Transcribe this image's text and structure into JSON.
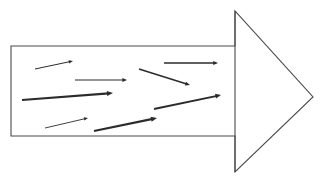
{
  "figure": {
    "canvas": {
      "width": 325,
      "height": 181,
      "background": "#ffffff"
    },
    "outline": {
      "name": "big-arrow-outline",
      "stroke_color": "#4a4a4a",
      "stroke_width": 1.1,
      "fill_color": "#ffffff",
      "shaft": {
        "left": 11,
        "top": 46,
        "right": 235,
        "bottom": 136
      },
      "head": {
        "base_x": 235,
        "top_y": 11,
        "bottom_y": 172,
        "tip_x": 313,
        "tip_y": 97
      }
    },
    "vectors": [
      {
        "name": "vector-arrow-1",
        "x1": 35,
        "y1": 69,
        "x2": 73,
        "y2": 61,
        "stroke_width": 1.0,
        "color": "#2b2b2b",
        "head_size": 4.2
      },
      {
        "name": "vector-arrow-2",
        "x1": 75,
        "y1": 80,
        "x2": 127,
        "y2": 80,
        "stroke_width": 1.2,
        "color": "#2b2b2b",
        "head_size": 4.6
      },
      {
        "name": "vector-arrow-3",
        "x1": 164,
        "y1": 63,
        "x2": 218,
        "y2": 63,
        "stroke_width": 1.3,
        "color": "#2b2b2b",
        "head_size": 4.8
      },
      {
        "name": "vector-arrow-4",
        "x1": 139,
        "y1": 69,
        "x2": 190,
        "y2": 85,
        "stroke_width": 1.5,
        "color": "#2b2b2b",
        "head_size": 4.8
      },
      {
        "name": "vector-arrow-5",
        "x1": 22,
        "y1": 100,
        "x2": 113,
        "y2": 93,
        "stroke_width": 2.1,
        "color": "#2b2b2b",
        "head_size": 6.0
      },
      {
        "name": "vector-arrow-6",
        "x1": 154,
        "y1": 109,
        "x2": 221,
        "y2": 95,
        "stroke_width": 1.9,
        "color": "#2b2b2b",
        "head_size": 5.6
      },
      {
        "name": "vector-arrow-7",
        "x1": 45,
        "y1": 128,
        "x2": 88,
        "y2": 118,
        "stroke_width": 0.9,
        "color": "#2b2b2b",
        "head_size": 4.0
      },
      {
        "name": "vector-arrow-8",
        "x1": 94,
        "y1": 131,
        "x2": 157,
        "y2": 118,
        "stroke_width": 2.2,
        "color": "#2b2b2b",
        "head_size": 6.0
      }
    ]
  }
}
